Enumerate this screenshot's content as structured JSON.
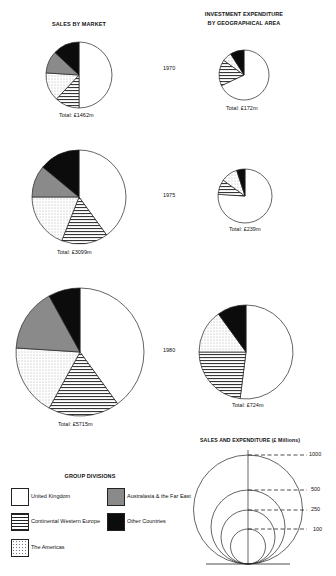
{
  "chart_data": [
    {
      "type": "pie",
      "title": "SALES BY MARKET",
      "panels": [
        {
          "year": "1970",
          "total_label": "Total: £1462m",
          "total": 1462,
          "slices": [
            {
              "name": "United Kingdom",
              "value": 50
            },
            {
              "name": "Continental Western Europe",
              "value": 12
            },
            {
              "name": "The Americas",
              "value": 14
            },
            {
              "name": "Australasia & the Far East",
              "value": 11
            },
            {
              "name": "Other Countries",
              "value": 13
            }
          ]
        },
        {
          "year": "1975",
          "total_label": "Total: £3099m",
          "total": 3099,
          "slices": [
            {
              "name": "United Kingdom",
              "value": 40
            },
            {
              "name": "Continental Western Europe",
              "value": 16
            },
            {
              "name": "The Americas",
              "value": 19
            },
            {
              "name": "Australasia & the Far East",
              "value": 11
            },
            {
              "name": "Other Countries",
              "value": 14
            }
          ]
        },
        {
          "year": "1980",
          "total_label": "Total: £5715m",
          "total": 5715,
          "slices": [
            {
              "name": "United Kingdom",
              "value": 40
            },
            {
              "name": "Continental Western Europe",
              "value": 18
            },
            {
              "name": "The Americas",
              "value": 18
            },
            {
              "name": "Australasia & the Far East",
              "value": 16
            },
            {
              "name": "Other Countries",
              "value": 8
            }
          ]
        }
      ]
    },
    {
      "type": "pie",
      "title": "INVESTMENT EXPENDITURE BY GEOGRAPHICAL AREA",
      "panels": [
        {
          "year": "1970",
          "total_label": "Total: £172m",
          "total": 172,
          "slices": [
            {
              "name": "United Kingdom",
              "value": 68
            },
            {
              "name": "Continental Western Europe",
              "value": 17
            },
            {
              "name": "The Americas",
              "value": 6
            },
            {
              "name": "Australasia & the Far East",
              "value": 0
            },
            {
              "name": "Other Countries",
              "value": 9
            }
          ]
        },
        {
          "year": "1975",
          "total_label": "Total: £239m",
          "total": 239,
          "slices": [
            {
              "name": "United Kingdom",
              "value": 76
            },
            {
              "name": "Continental Western Europe",
              "value": 9
            },
            {
              "name": "The Americas",
              "value": 10
            },
            {
              "name": "Australasia & the Far East",
              "value": 0
            },
            {
              "name": "Other Countries",
              "value": 5
            }
          ]
        },
        {
          "year": "1980",
          "total_label": "Total: £724m",
          "total": 724,
          "slices": [
            {
              "name": "United Kingdom",
              "value": 52
            },
            {
              "name": "Continental Western Europe",
              "value": 23
            },
            {
              "name": "The Americas",
              "value": 15
            },
            {
              "name": "Australasia & the Far East",
              "value": 0
            },
            {
              "name": "Other Countries",
              "value": 10
            }
          ]
        }
      ]
    },
    {
      "type": "scale",
      "title": "SALES AND EXPENDITURE (£ Millions)",
      "ticks": [
        "1000",
        "500",
        "250",
        "100"
      ],
      "values": [
        1000,
        500,
        250,
        100
      ]
    }
  ],
  "titles": {
    "sales": "SALES BY MARKET",
    "investment_line1": "INVESTMENT EXPENDITURE",
    "investment_line2": "BY GEOGRAPHICAL AREA",
    "scale": "SALES AND EXPENDITURE (£ Millions)"
  },
  "years": [
    "1970",
    "1975",
    "1980"
  ],
  "totals": {
    "sales": [
      "Total: £1462m",
      "Total: £3099m",
      "Total: £5715m"
    ],
    "investment": [
      "Total: £172m",
      "Total: £239m",
      "Total: £724m"
    ]
  },
  "legend": {
    "title": "GROUP DIVISIONS",
    "items": [
      {
        "label": "United Kingdom",
        "pattern": "blank"
      },
      {
        "label": "Australasia & the Far East",
        "pattern": "grey"
      },
      {
        "label": "Continental Western Europe",
        "pattern": "hatched"
      },
      {
        "label": "Other Countries",
        "pattern": "black"
      },
      {
        "label": "The Americas",
        "pattern": "dotted"
      }
    ]
  },
  "scale_ticks": [
    "1000",
    "500",
    "250",
    "100"
  ],
  "colors": {
    "grey": "#8a8a8a",
    "black": "#0c0c0c",
    "stroke": "#222222"
  }
}
